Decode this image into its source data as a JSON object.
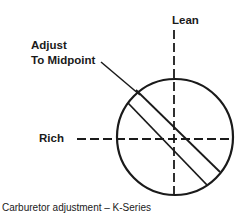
{
  "diagram": {
    "labels": {
      "lean": "Lean",
      "adjust_line1": "Adjust",
      "adjust_line2": "To Midpoint",
      "rich": "Rich"
    },
    "caption": "Carburetor adjustment – K-Series",
    "colors": {
      "ink": "#1a1a1a",
      "background": "#ffffff"
    }
  }
}
